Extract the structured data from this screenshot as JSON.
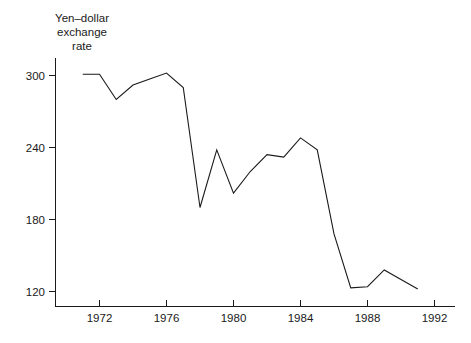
{
  "chart_data": {
    "type": "line",
    "title": "Yen–dollar exchange rate",
    "title_lines": [
      "Yen–dollar",
      "exchange",
      "rate"
    ],
    "xlabel": "",
    "ylabel": "",
    "x": [
      1971,
      1972,
      1973,
      1974,
      1975,
      1976,
      1977,
      1978,
      1979,
      1980,
      1981,
      1982,
      1983,
      1984,
      1985,
      1986,
      1987,
      1988,
      1989,
      1990,
      1991
    ],
    "values": [
      301,
      301,
      280,
      292,
      297,
      302,
      290,
      190,
      238,
      202,
      220,
      234,
      232,
      248,
      238,
      168,
      123,
      124,
      138,
      130,
      122
    ],
    "series": [
      {
        "name": "Yen–dollar exchange rate",
        "values": [
          301,
          301,
          280,
          292,
          297,
          302,
          290,
          190,
          238,
          202,
          220,
          234,
          232,
          248,
          238,
          168,
          123,
          124,
          138,
          130,
          122
        ]
      }
    ],
    "xlim": [
      1971,
      1992
    ],
    "ylim": [
      120,
      318
    ],
    "xticks": [
      1972,
      1976,
      1980,
      1984,
      1988,
      1992
    ],
    "xtick_labels": [
      "1972",
      "1976",
      "1980",
      "1984",
      "1988",
      "1992"
    ],
    "yticks": [
      120,
      180,
      240,
      300
    ],
    "ytick_labels": [
      "120",
      "180",
      "240",
      "300"
    ],
    "grid": false,
    "legend": false,
    "line_color": "#1a1a1a",
    "background_color": "#ffffff"
  },
  "axes": {
    "x_axis_name": "year-axis",
    "y_axis_name": "exchange-rate-axis"
  }
}
